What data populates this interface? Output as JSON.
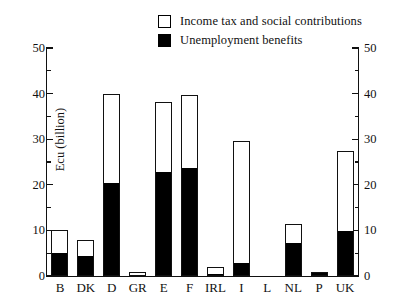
{
  "chart_data": {
    "type": "bar",
    "subtype": "stacked-bar",
    "title": "",
    "xlabel": "",
    "ylabel": "Ecu (billion)",
    "ylim": [
      0,
      50
    ],
    "y_ticks_major": [
      0,
      10,
      20,
      30,
      40,
      50
    ],
    "y_ticks_minor": [
      5,
      15,
      25,
      35,
      45
    ],
    "grid": false,
    "legend_position": "top-right",
    "dual_y_axis": true,
    "right_axis_ticks": [
      0,
      10,
      20,
      30,
      40,
      50
    ],
    "categories": [
      "B",
      "DK",
      "D",
      "GR",
      "E",
      "F",
      "IRL",
      "I",
      "L",
      "NL",
      "P",
      "UK"
    ],
    "series": [
      {
        "name": "Unemployment benefits",
        "color": "#000000",
        "values": [
          5.0,
          4.3,
          20.4,
          0.2,
          22.9,
          23.6,
          0.5,
          2.9,
          0.0,
          7.3,
          0.6,
          9.8
        ]
      },
      {
        "name": "Income tax and social contributions",
        "color": "#ffffff",
        "values": [
          5.0,
          3.7,
          19.6,
          0.6,
          15.2,
          16.2,
          1.4,
          26.7,
          0.0,
          4.1,
          0.1,
          17.7
        ]
      }
    ],
    "totals": [
      10.0,
      8.0,
      40.0,
      0.8,
      38.1,
      39.8,
      1.9,
      29.6,
      0.0,
      11.4,
      0.7,
      27.5
    ]
  },
  "legend": {
    "items": [
      {
        "label": "Income tax and social contributions",
        "swatch": "hollow"
      },
      {
        "label": "Unemployment benefits",
        "swatch": "filled"
      }
    ]
  },
  "axes": {
    "y_title": "Ecu (billion)",
    "left_tick_labels": [
      "50",
      "40",
      "30",
      "20",
      "10",
      "0"
    ],
    "right_tick_labels": [
      "50",
      "40",
      "30",
      "20",
      "10",
      "0"
    ],
    "x_tick_labels": [
      "B",
      "DK",
      "D",
      "GR",
      "E",
      "F",
      "IRL",
      "I",
      "L",
      "NL",
      "P",
      "UK"
    ]
  }
}
